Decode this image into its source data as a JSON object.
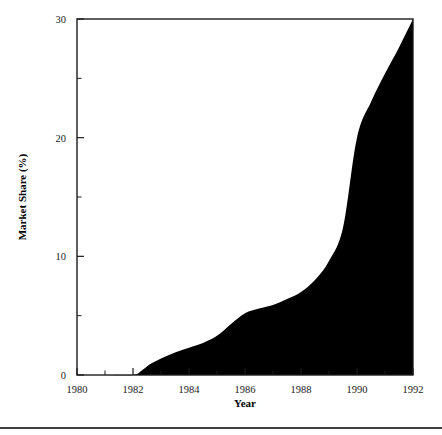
{
  "chart_data": {
    "type": "area",
    "title": "",
    "subtitle": "",
    "xlabel": "Year",
    "ylabel": "Market Share (%)",
    "xlim": [
      1980,
      1992
    ],
    "ylim": [
      0,
      30
    ],
    "grid": false,
    "legend": false,
    "legend_position": "none",
    "fill_color": "#000000",
    "x_major_ticks": [
      1980,
      1982,
      1984,
      1986,
      1988,
      1990,
      1992
    ],
    "x_major_tick_labels": [
      "1980",
      "1982",
      "1984",
      "1986",
      "1988",
      "1990",
      "1992"
    ],
    "x_minor_ticks": [
      1981,
      1983,
      1985,
      1987,
      1989,
      1991
    ],
    "y_major_ticks": [
      0,
      10,
      20,
      30
    ],
    "y_major_tick_labels": [
      "0",
      "10",
      "20",
      "30"
    ],
    "y_minor_ticks": [
      5,
      15,
      25
    ],
    "series": [
      {
        "name": "Market Share",
        "x": [
          1980.0,
          1981.0,
          1982.0,
          1982.3,
          1982.6,
          1983.0,
          1983.5,
          1984.0,
          1984.5,
          1985.0,
          1985.5,
          1986.0,
          1986.5,
          1987.0,
          1987.5,
          1988.0,
          1988.5,
          1989.0,
          1989.5,
          1990.0,
          1990.5,
          1991.0,
          1991.5,
          1992.0
        ],
        "values": [
          0.0,
          0.0,
          0.0,
          0.35,
          0.9,
          1.4,
          1.9,
          2.3,
          2.7,
          3.3,
          4.3,
          5.2,
          5.6,
          5.9,
          6.4,
          7.0,
          8.0,
          9.6,
          12.4,
          20.0,
          23.0,
          25.4,
          27.6,
          30.0
        ]
      }
    ],
    "annotations": []
  },
  "footer": {
    "rule_color": "#000000"
  }
}
